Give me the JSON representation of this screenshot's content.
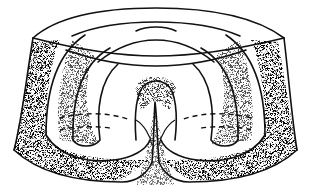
{
  "figure": {
    "type": "topology-diagram",
    "colors": {
      "stroke": "#111111",
      "background": "#ffffff",
      "stipple": "#222222"
    }
  }
}
